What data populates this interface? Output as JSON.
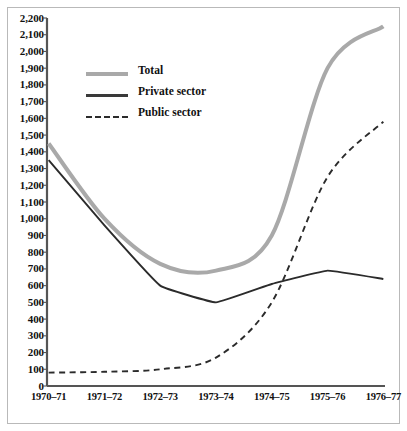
{
  "chart_data": {
    "type": "line",
    "title": "",
    "subtitle": "",
    "xlabel": "",
    "ylabel": "",
    "categories": [
      "1970–71",
      "1971–72",
      "1972–73",
      "1973–74",
      "1974–75",
      "1975–76",
      "1976–77"
    ],
    "ylim": [
      0,
      2200
    ],
    "ytick_values": [
      0,
      100,
      200,
      300,
      400,
      500,
      600,
      700,
      800,
      900,
      1000,
      1100,
      1200,
      1300,
      1400,
      1500,
      1600,
      1700,
      1800,
      1900,
      2000,
      2100,
      2200
    ],
    "ytick_labels": [
      "0",
      "100",
      "200",
      "300",
      "400",
      "500",
      "600",
      "700",
      "800",
      "900",
      "1,000",
      "1,100",
      "1,200",
      "1,300",
      "1,400",
      "1,500",
      "1,600",
      "1,700",
      "1,800",
      "1,900",
      "2,000",
      "2,100",
      "2,200"
    ],
    "grid": false,
    "legend_position": "upper-left",
    "series": [
      {
        "name": "Total",
        "style": "solid-thick-gray",
        "color": "#a9a9a9",
        "values": [
          1450,
          1000,
          730,
          690,
          900,
          1900,
          2150
        ]
      },
      {
        "name": "Private sector",
        "style": "solid-thin-black",
        "color": "#2b2b2b",
        "values": [
          1350,
          960,
          600,
          500,
          610,
          690,
          640
        ]
      },
      {
        "name": "Public sector",
        "style": "dashed-black",
        "color": "#2b2b2b",
        "values": [
          80,
          85,
          100,
          170,
          500,
          1250,
          1580
        ]
      }
    ]
  },
  "legend": {
    "items": [
      {
        "label": "Total"
      },
      {
        "label": "Private sector"
      },
      {
        "label": "Public sector"
      }
    ]
  },
  "axes": {
    "y_axis_name": "y-axis",
    "x_axis_name": "x-axis"
  },
  "colors": {
    "total": "#a9a9a9",
    "private": "#2b2b2b",
    "public": "#2b2b2b",
    "axis": "#555555",
    "text": "#111111",
    "frame": "#b9b9b9",
    "background": "#ffffff"
  }
}
